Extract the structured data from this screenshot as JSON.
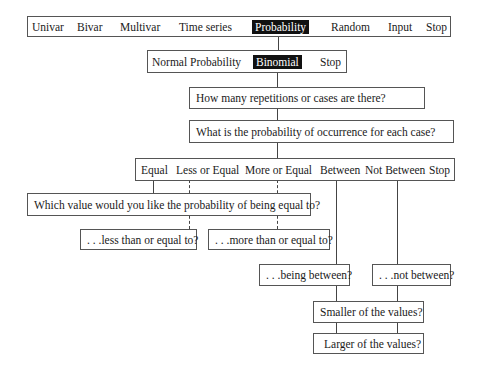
{
  "main_menu": {
    "items": [
      {
        "label": "Univar",
        "selected": false
      },
      {
        "label": "Bivar",
        "selected": false
      },
      {
        "label": "Multivar",
        "selected": false
      },
      {
        "label": "Time series",
        "selected": false
      },
      {
        "label": "Probability",
        "selected": true
      },
      {
        "label": "Random",
        "selected": false
      },
      {
        "label": "Input",
        "selected": false
      },
      {
        "label": "Stop",
        "selected": false
      }
    ]
  },
  "probability_menu": {
    "items": [
      {
        "label": "Normal Probability",
        "selected": false
      },
      {
        "label": "Binomial",
        "selected": true
      },
      {
        "label": "Stop",
        "selected": false
      }
    ]
  },
  "prompts": {
    "repetitions": "How many repetitions or cases are there?",
    "probability": "What is the probability of occurrence for each case?"
  },
  "comparison_menu": {
    "items": [
      {
        "label": "Equal"
      },
      {
        "label": "Less or Equal"
      },
      {
        "label": "More or Equal"
      },
      {
        "label": "Between"
      },
      {
        "label": "Not Between"
      },
      {
        "label": "Stop"
      }
    ]
  },
  "value_prompts": {
    "equal": "Which value would you like the probability of being equal to?",
    "less_equal": ". . .less than or equal to?",
    "more_equal": ". . .more than or equal to?",
    "between": ". . .being between?",
    "not_between": ". . .not between?",
    "smaller": "Smaller of the values?",
    "larger": "Larger of the values?"
  },
  "colors": {
    "highlight_bg": "#111111",
    "highlight_fg": "#ffffff",
    "border": "#555555"
  }
}
